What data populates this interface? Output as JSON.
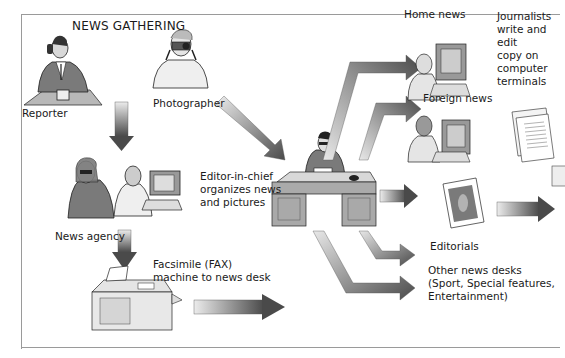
{
  "title": "NEWS GATHERING",
  "sources": {
    "reporter": "Reporter",
    "photographer": "Photographer",
    "news_agency": "News agency",
    "fax": "Facsimile (FAX)\nmachine to news desk"
  },
  "hub": {
    "editor": "Editor-in-chief\norganizes news\nand pictures"
  },
  "desks": {
    "home_news": "Home news",
    "foreign_news": "Foreign news",
    "journalists": "Journalists\nwrite and edit\ncopy on\ncomputer\nterminals",
    "editorials": "Editorials",
    "other_desks": "Other news desks\n(Sport, Special features,\nEntertainment)"
  },
  "colors": {
    "arrow_light": "#e8e8e8",
    "arrow_dark": "#555555",
    "frame": "#9a9a9a",
    "desk": "#a9a9a9"
  }
}
